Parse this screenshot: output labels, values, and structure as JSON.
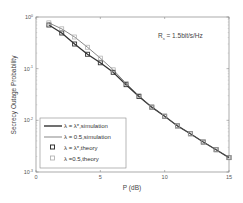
{
  "chart_data": {
    "type": "line",
    "title": "",
    "xlabel": "P (dB)",
    "ylabel": "Secrecy Outage Probability",
    "xlim": [
      0,
      15
    ],
    "ylim": [
      0.001,
      1
    ],
    "yscale": "log",
    "x_ticks": [
      "0",
      "5",
      "10",
      "15"
    ],
    "y_ticks": [
      "10^0",
      "10^-1",
      "10^-2",
      "10^-3"
    ],
    "grid": false,
    "legend_position": "lower left",
    "annotation": "R_s = 1.5bit/s/Hz",
    "x": [
      1,
      2,
      3,
      4,
      5,
      6,
      7,
      8,
      9,
      10,
      11,
      12,
      13,
      14,
      15
    ],
    "series": [
      {
        "name": "λ = λ*, simulation",
        "style": "thick-line",
        "color": "#333333",
        "values": [
          0.7,
          0.49,
          0.3,
          0.19,
          0.13,
          0.085,
          0.049,
          0.029,
          0.018,
          0.012,
          0.0078,
          0.0055,
          0.0038,
          0.0027,
          0.0019
        ]
      },
      {
        "name": "λ = 0.5, simulation",
        "style": "thin-line",
        "color": "#555555",
        "values": [
          0.77,
          0.59,
          0.41,
          0.26,
          0.16,
          0.095,
          0.052,
          0.03,
          0.018,
          0.012,
          0.0078,
          0.0055,
          0.0038,
          0.0027,
          0.0019
        ]
      },
      {
        "name": "λ = λ*, theory",
        "style": "marker-dark-square",
        "color": "#333333",
        "values": [
          0.7,
          0.49,
          0.3,
          0.19,
          0.13,
          0.085,
          0.049,
          0.029,
          0.018,
          0.012,
          0.0078,
          0.0055,
          0.0038,
          0.0027,
          0.0019
        ]
      },
      {
        "name": "λ = 0.5, theory",
        "style": "marker-light-square",
        "color": "#999999",
        "values": [
          0.77,
          0.59,
          0.41,
          0.26,
          0.16,
          0.095,
          0.052,
          0.03,
          0.018,
          0.012,
          0.0078,
          0.0055,
          0.0038,
          0.0027,
          0.0019
        ]
      }
    ]
  },
  "legend": {
    "items": [
      {
        "label": "λ  = λ*,simulation"
      },
      {
        "label": "λ  = 0.5,simulation"
      },
      {
        "label": "λ  = λ*,theory"
      },
      {
        "label": "λ  =0.5,theory"
      }
    ]
  },
  "annotation": {
    "text": "R",
    "sub": "s",
    "rest": " = 1.5bit/s/Hz"
  },
  "axes": {
    "xlabel": "P (dB)",
    "ylabel": "Secrecy Outage Probability"
  }
}
